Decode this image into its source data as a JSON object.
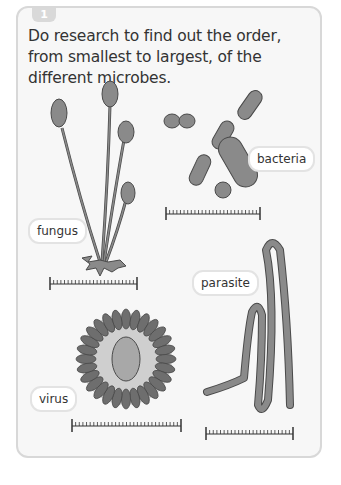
{
  "activity": {
    "number": "1",
    "question": "Do research to find out the order, from smallest to largest, of the different microbes."
  },
  "microbes": [
    {
      "name": "fungus",
      "label": "fungus"
    },
    {
      "name": "bacteria",
      "label": "bacteria"
    },
    {
      "name": "virus",
      "label": "virus"
    },
    {
      "name": "parasite",
      "label": "parasite"
    }
  ],
  "colors": {
    "organism_fill": "#8a8a8a",
    "organism_outline": "#4a4a4a",
    "virus_body": "#cfcfcf",
    "card_bg": "#f7f7f7",
    "card_border": "#d8d8d8"
  }
}
